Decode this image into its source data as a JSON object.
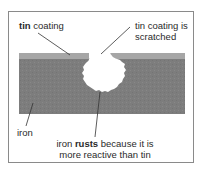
{
  "diagram": {
    "labels": {
      "tin_coating": {
        "bold": "tin",
        "rest": " coating"
      },
      "scratched": {
        "line1": "tin coating is",
        "line2": "scratched"
      },
      "iron": "iron",
      "rusts": {
        "pre": "iron ",
        "bold": "rusts",
        "post": " because it is",
        "line2": "more reactive than tin"
      }
    },
    "colors": {
      "iron": "#7d7d7d",
      "tin": "#a6a6a6",
      "frame": "#8a8a8a",
      "pointer": "#333333"
    }
  }
}
